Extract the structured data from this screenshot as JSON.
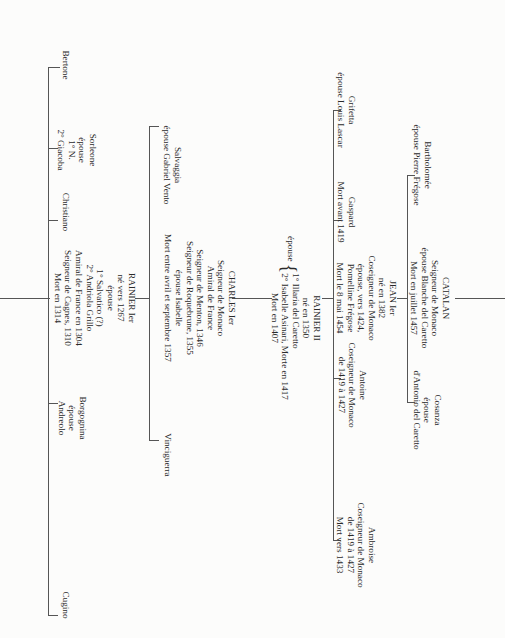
{
  "tree": {
    "gen1": [
      {
        "id": "cugino",
        "lines": [
          "Cugino"
        ]
      },
      {
        "id": "borgognina",
        "lines": [
          "Borgognina",
          "épouse",
          "Andreolo"
        ]
      },
      {
        "id": "rainier1",
        "lines": [
          "RAINIER Ier",
          "né vers 1267",
          "épouse",
          "1° Salvatico (?)",
          "2° Andriola Grillo",
          "Amiral de France en 1304",
          "Seigneur de Cagnes, 1310",
          "Mort en 1314"
        ]
      },
      {
        "id": "christiano",
        "lines": [
          "Christiano"
        ]
      },
      {
        "id": "sorleone",
        "lines": [
          "Sorleone",
          "épouse",
          "1° N.",
          "2° Giacoba"
        ]
      },
      {
        "id": "bertone",
        "lines": [
          "Bertone"
        ]
      }
    ],
    "gen2": [
      {
        "id": "vinciguerra",
        "lines": [
          "Vinciguerra"
        ]
      },
      {
        "id": "charles1",
        "lines": [
          "CHARLES Ier",
          "Seigneur de Monaco",
          "Amiral de France",
          "Seigneur de Menton, 1346",
          "Seigneur de Roquebrune, 1355",
          "épouse Isabelle",
          "Mort entre avril et septembre 1357"
        ]
      },
      {
        "id": "salvaggia",
        "lines": [
          "Salvaggia",
          "épouse Gabriel Vento"
        ]
      }
    ],
    "gen3": [
      {
        "id": "rainier2",
        "title": "RAINIER II",
        "born": "né en 1350",
        "spouse_label": "épouse",
        "spouses": [
          "1° Illaria del Caretto",
          "2° Isabelle Asinari, Morte en 1417"
        ],
        "death": "Mort en 1407"
      }
    ],
    "gen4": [
      {
        "id": "ambroise",
        "lines": [
          "Ambroise",
          "Coseigneur de Monaco",
          "de 1419 à 1427",
          "Mort vers 1433"
        ]
      },
      {
        "id": "antoine",
        "lines": [
          "Antoine",
          "Coseigneur de Monaco",
          "de 1419 à 1427"
        ]
      },
      {
        "id": "jean1",
        "lines": [
          "JEAN Ier",
          "né en 1382",
          "Coseigneur de Monaco",
          "épouse, vers 1424,",
          "Pomelline Frégose",
          "Mort le 8 mai 1454"
        ]
      },
      {
        "id": "gaspard",
        "lines": [
          "Gaspard",
          "Mort avant 1419"
        ]
      },
      {
        "id": "grifetta",
        "lines": [
          "Grifetta",
          "épouse Louis Lascar"
        ]
      }
    ],
    "gen5": [
      {
        "id": "cosanza",
        "lines": [
          "Cosanza",
          "épouse",
          "d'Antonio del Caretto"
        ]
      },
      {
        "id": "catalan",
        "lines": [
          "CATALAN",
          "Seigneur de Monaco",
          "épouse Blanche del Caretto",
          "Mort en juillet 1457"
        ]
      },
      {
        "id": "bartholomee",
        "lines": [
          "Bartholomée",
          "épouse Pierre Frégose"
        ]
      }
    ]
  }
}
